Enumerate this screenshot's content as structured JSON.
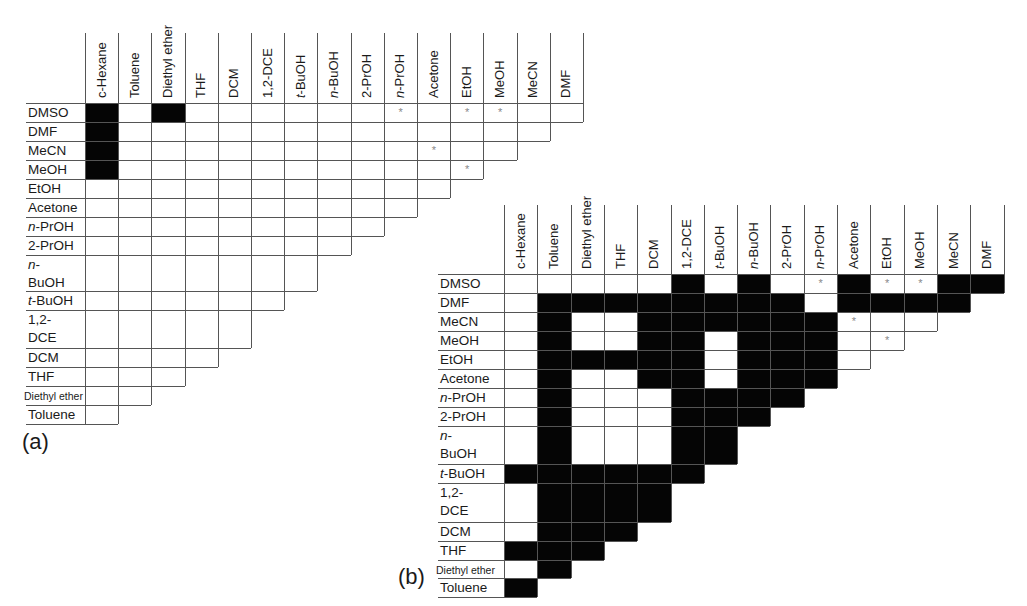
{
  "figure": {
    "panels": [
      {
        "id": "a",
        "panel_label": "(a)",
        "columns": [
          "c-Hexane",
          "Toluene",
          "Diethyl ether",
          "THF",
          "DCM",
          "1,2-DCE",
          "t-BuOH",
          "n-BuOH",
          "2-PrOH",
          "n-PrOH",
          "Acetone",
          "EtOH",
          "MeOH",
          "MeCN",
          "DMF"
        ],
        "rows": [
          {
            "label": "DMSO",
            "cells": "BWBWWWWWWSWSSWW"
          },
          {
            "label": "DMF",
            "cells": "BWWWWWWWWWWWWW"
          },
          {
            "label": "MeCN",
            "cells": "BWWWWWWWWWSWW"
          },
          {
            "label": "MeOH",
            "cells": "BWWWWWWWWWWS"
          },
          {
            "label": "EtOH",
            "cells": "WWWWWWWWWWW"
          },
          {
            "label": "Acetone",
            "cells": "WWWWWWWWWW"
          },
          {
            "label": "n-PrOH",
            "cells": "WWWWWWWWW"
          },
          {
            "label": "2-PrOH",
            "cells": "WWWWWWWW"
          },
          {
            "label": "n-BuOH",
            "cells": "WWWWWWW"
          },
          {
            "label": "t-BuOH",
            "cells": "WWWWWW"
          },
          {
            "label": "1,2-DCE",
            "cells": "WWWWW"
          },
          {
            "label": "DCM",
            "cells": "WWWW"
          },
          {
            "label": "THF",
            "cells": "WWW"
          },
          {
            "label": "Diethyl ether",
            "cells": "WW"
          },
          {
            "label": "Toluene",
            "cells": "W"
          }
        ]
      },
      {
        "id": "b",
        "panel_label": "(b)",
        "columns": [
          "c-Hexane",
          "Toluene",
          "Diethyl ether",
          "THF",
          "DCM",
          "1,2-DCE",
          "t-BuOH",
          "n-BuOH",
          "2-PrOH",
          "n-PrOH",
          "Acetone",
          "EtOH",
          "MeOH",
          "MeCN",
          "DMF"
        ],
        "rows": [
          {
            "label": "DMSO",
            "cells": "WWWWWBWBWSBSSBB"
          },
          {
            "label": "DMF",
            "cells": "WBBBBBBBBWBBBB"
          },
          {
            "label": "MeCN",
            "cells": "WBWWBBBBBBSWW"
          },
          {
            "label": "MeOH",
            "cells": "WBWWBBWBBBWS"
          },
          {
            "label": "EtOH",
            "cells": "WBBBBBWBBBW"
          },
          {
            "label": "Acetone",
            "cells": "WBWWBBWBBB"
          },
          {
            "label": "n-PrOH",
            "cells": "WBWWWBBBB"
          },
          {
            "label": "2-PrOH",
            "cells": "WBWWWBBB"
          },
          {
            "label": "n-BuOH",
            "cells": "WBWWWBB"
          },
          {
            "label": "t-BuOH",
            "cells": "BBBBBB"
          },
          {
            "label": "1,2-DCE",
            "cells": "WBBBB"
          },
          {
            "label": "DCM",
            "cells": "WBBB"
          },
          {
            "label": "THF",
            "cells": "BBB"
          },
          {
            "label": "Diethyl ether",
            "cells": "WB"
          },
          {
            "label": "Toluene",
            "cells": "B"
          }
        ]
      }
    ],
    "legend": {
      "B": "black (filled) cell",
      "W": "white (empty) cell",
      "S": "white cell marked with asterisk",
      "asterisk": "*"
    },
    "colors": {
      "filled": "#050505",
      "empty": "#ffffff",
      "grid": "#555555",
      "asterisk": "#888888"
    }
  }
}
